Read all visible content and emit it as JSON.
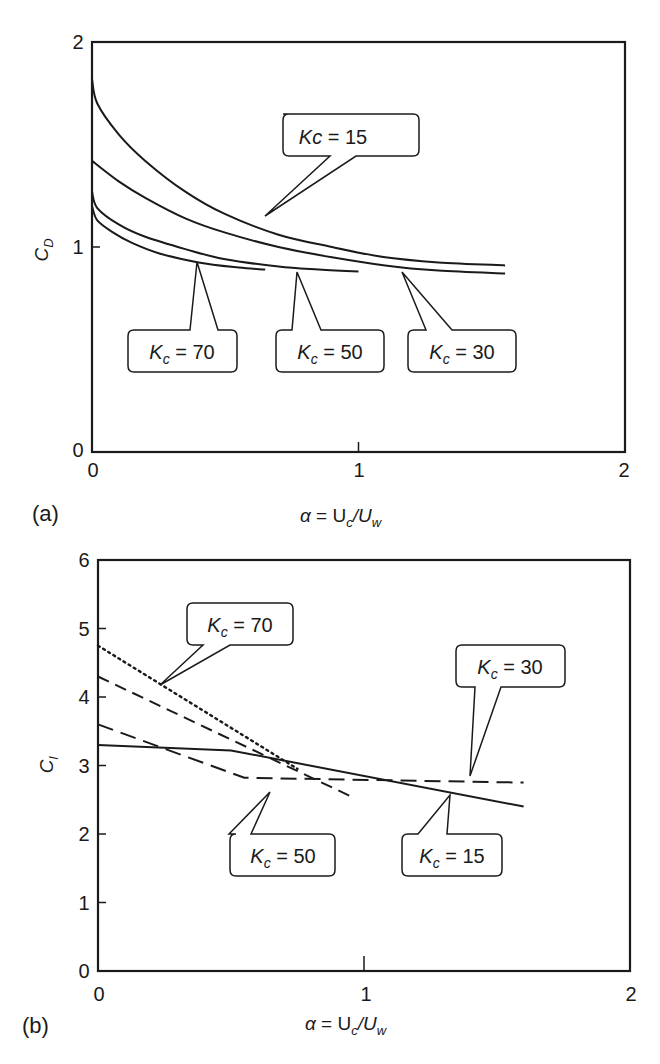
{
  "chart_data": [
    {
      "type": "line",
      "panel": "(a)",
      "title": "",
      "xlabel": "α = U_c/U_w",
      "ylabel": "C_D",
      "xlim": [
        0,
        2
      ],
      "ylim": [
        0,
        2
      ],
      "xticks": [
        "0",
        "1",
        "2"
      ],
      "yticks": [
        "0",
        "1",
        "2"
      ],
      "grid": false,
      "legend": "callout labels",
      "series": [
        {
          "name": "Kc = 15",
          "style": "solid",
          "x": [
            0,
            0.02,
            0.1,
            0.2,
            0.35,
            0.5,
            0.7,
            0.9,
            1.1,
            1.3,
            1.55
          ],
          "y": [
            1.82,
            1.7,
            1.55,
            1.42,
            1.27,
            1.16,
            1.06,
            1.0,
            0.95,
            0.925,
            0.91
          ]
        },
        {
          "name": "K_c = 30",
          "style": "solid",
          "x": [
            0,
            0.1,
            0.2,
            0.35,
            0.5,
            0.7,
            0.9,
            1.1,
            1.3,
            1.55
          ],
          "y": [
            1.42,
            1.32,
            1.24,
            1.14,
            1.07,
            1.0,
            0.95,
            0.91,
            0.885,
            0.87
          ]
        },
        {
          "name": "K_c = 50",
          "style": "solid",
          "x": [
            0,
            0.02,
            0.1,
            0.2,
            0.35,
            0.5,
            0.7,
            0.85,
            1.0
          ],
          "y": [
            1.27,
            1.19,
            1.11,
            1.05,
            0.99,
            0.94,
            0.905,
            0.89,
            0.88
          ]
        },
        {
          "name": "K_c = 70",
          "style": "solid",
          "x": [
            0,
            0.02,
            0.08,
            0.15,
            0.25,
            0.4,
            0.55,
            0.65
          ],
          "y": [
            1.2,
            1.13,
            1.07,
            1.02,
            0.97,
            0.925,
            0.9,
            0.89
          ]
        }
      ]
    },
    {
      "type": "line",
      "panel": "(b)",
      "title": "",
      "xlabel": "α = U_c/U_w",
      "ylabel": "C_l",
      "xlim": [
        0,
        2
      ],
      "ylim": [
        0,
        6
      ],
      "xticks": [
        "0",
        "1",
        "2"
      ],
      "yticks": [
        "0",
        "1",
        "2",
        "3",
        "4",
        "5",
        "6"
      ],
      "grid": false,
      "legend": "callout labels",
      "series": [
        {
          "name": "K_c = 15",
          "style": "solid",
          "x": [
            0,
            0.5,
            1.6
          ],
          "y": [
            3.3,
            3.22,
            2.4
          ]
        },
        {
          "name": "K_c = 30",
          "style": "long-dash",
          "x": [
            0,
            0.55,
            1.6
          ],
          "y": [
            3.6,
            2.82,
            2.75
          ]
        },
        {
          "name": "K_c = 50",
          "style": "dash",
          "x": [
            0,
            0.95
          ],
          "y": [
            4.3,
            2.55
          ]
        },
        {
          "name": "K_c = 70",
          "style": "dotted",
          "x": [
            0,
            0.75
          ],
          "y": [
            4.75,
            2.95
          ]
        }
      ]
    }
  ],
  "panels": {
    "a": {
      "label": "(a)",
      "ylabel_main": "C",
      "ylabel_sub": "D",
      "xlabel": {
        "alpha": "α",
        "eq": " = U",
        "c": "c",
        "slash": "/U",
        "w": "w"
      },
      "callouts": [
        {
          "k": "Kc",
          "sub": "",
          "text": " = 15"
        },
        {
          "k": "K",
          "sub": "c",
          "text": " = 70"
        },
        {
          "k": "K",
          "sub": "c",
          "text": " = 50"
        },
        {
          "k": "K",
          "sub": "c",
          "text": " = 30"
        }
      ]
    },
    "b": {
      "label": "(b)",
      "ylabel_main": "C",
      "ylabel_sub": "l",
      "xlabel": {
        "alpha": "α",
        "eq": " = U",
        "c": "c",
        "slash": "/U",
        "w": "w"
      },
      "callouts": [
        {
          "k": "K",
          "sub": "c",
          "text": " = 70"
        },
        {
          "k": "K",
          "sub": "c",
          "text": " = 30"
        },
        {
          "k": "K",
          "sub": "c",
          "text": " = 50"
        },
        {
          "k": "K",
          "sub": "c",
          "text": " = 15"
        }
      ]
    }
  }
}
